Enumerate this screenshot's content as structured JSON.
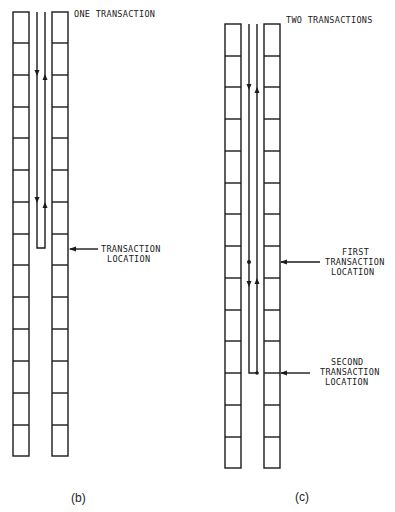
{
  "figure_b": {
    "caption": "(b)",
    "title": "ONE TRANSACTION",
    "cell_count": 14,
    "annotations": [
      {
        "line1": "TRANSACTION",
        "line2": "LOCATION"
      }
    ]
  },
  "figure_c": {
    "caption": "(c)",
    "title": "TWO TRANSACTIONS",
    "cell_count": 14,
    "annotations": [
      {
        "line1": "FIRST",
        "line2": "TRANSACTION",
        "line3": "LOCATION"
      },
      {
        "line1": "SECOND",
        "line2": "TRANSACTION",
        "line3": "LOCATION"
      }
    ]
  },
  "colors": {
    "ink": "#1a1a1a",
    "background": "#ffffff"
  }
}
